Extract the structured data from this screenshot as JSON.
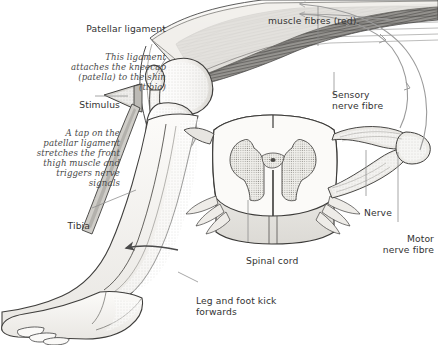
{
  "figure": {
    "width": 438,
    "height": 345,
    "background": "#ffffff",
    "ink": "#3b3b3b"
  },
  "labels": {
    "patellar_ligament": {
      "heading": "Patellar ligament",
      "body": "This ligament\nattaches the kneecap\n(patella) to the shin\n(tibia)",
      "align": "right"
    },
    "stimulus": {
      "heading": "Stimulus",
      "body": "A tap on the\npatellar ligament\nstretches the front\nthigh muscle and\ntriggers nerve\nsignals",
      "align": "right"
    },
    "muscle_fibres": {
      "heading": "",
      "body": "muscle fibres (red).",
      "align": "left"
    },
    "sensory_nerve_fibre": {
      "heading": "Sensory\nnerve fibre",
      "body": "",
      "align": "left"
    },
    "nerve": {
      "heading": "Nerve",
      "body": "",
      "align": "left"
    },
    "motor_nerve_fibre": {
      "heading": "Motor\nnerve fibre",
      "body": "",
      "align": "right"
    },
    "spinal_cord": {
      "heading": "Spinal cord",
      "body": "",
      "align": "left"
    },
    "tibia": {
      "heading": "Tibia",
      "body": "",
      "align": "right"
    },
    "leg_kick": {
      "heading": "Leg and foot kick\nforwards",
      "body": "",
      "align": "left"
    }
  },
  "colors": {
    "line": "#444444",
    "leader": "#8a8a8a",
    "muscle_dark": "#6f6f6f",
    "muscle_mid": "#9a9a9a",
    "bone_fill": "#f2f1ee",
    "bone_shade": "#d8d6d1",
    "skin_fill": "#fbfaf8",
    "skin_shade": "#e6e4e0",
    "grey_matter": "#cfcdc8",
    "nerve_arrow": "#9b9b9b"
  },
  "annotations": {
    "arrow_directions": [
      "sensory signal travels from knee toward spinal cord",
      "motor signal travels from spinal cord back to thigh muscle",
      "leg and foot kick forwards"
    ]
  }
}
